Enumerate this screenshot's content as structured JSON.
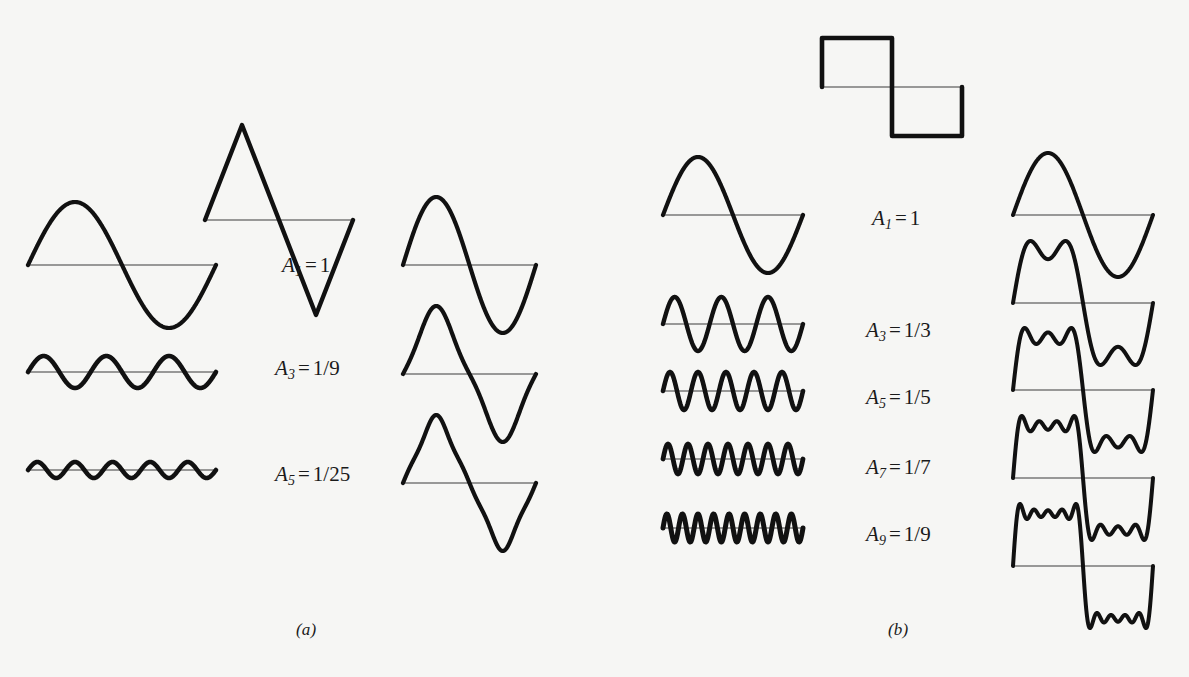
{
  "figure": {
    "background_color": "#f6f6f4",
    "ink_color": "#111111",
    "width": 1189,
    "height": 677
  },
  "panels": [
    {
      "id": "a",
      "label": "(a)",
      "label_x": 296,
      "label_y": 620,
      "target_waveform": "triangle",
      "target": {
        "x": 205,
        "y": 125,
        "width": 148,
        "height": 190,
        "period_points": [
          [
            0,
            0
          ],
          [
            0.25,
            1
          ],
          [
            0.75,
            -1
          ],
          [
            1,
            0
          ]
        ]
      },
      "amplitude_labels": [
        {
          "harmonic": "1",
          "value": "1",
          "x": 282,
          "y": 253
        },
        {
          "harmonic": "3",
          "value": "1/9",
          "x": 275,
          "y": 356
        },
        {
          "harmonic": "5",
          "value": "1/25",
          "x": 275,
          "y": 462
        }
      ],
      "components": [
        {
          "harmonic": 1,
          "amplitude": 1.0,
          "cycles": 1,
          "baseline_x": 28,
          "baseline_y": 265,
          "length": 188,
          "pixel_amplitude": 63,
          "stroke": 4.2
        },
        {
          "harmonic": 3,
          "amplitude": 0.1111,
          "cycles": 3,
          "baseline_x": 28,
          "baseline_y": 372,
          "length": 188,
          "pixel_amplitude": 16,
          "stroke": 4.6
        },
        {
          "harmonic": 5,
          "amplitude": 0.04,
          "cycles": 5,
          "baseline_x": 28,
          "baseline_y": 470,
          "length": 188,
          "pixel_amplitude": 8,
          "stroke": 4.6
        }
      ],
      "partial_sums": [
        {
          "through_harmonic": 1,
          "terms": [
            1
          ],
          "baseline_x": 403,
          "baseline_y": 265,
          "length": 133,
          "pixel_amplitude": 68,
          "stroke": 4.2
        },
        {
          "through_harmonic": 3,
          "terms": [
            1,
            3
          ],
          "baseline_x": 403,
          "baseline_y": 374,
          "length": 133,
          "pixel_amplitude": 68,
          "stroke": 4.2
        },
        {
          "through_harmonic": 5,
          "terms": [
            1,
            3,
            5
          ],
          "baseline_x": 403,
          "baseline_y": 483,
          "length": 133,
          "pixel_amplitude": 68,
          "stroke": 4.2
        }
      ]
    },
    {
      "id": "b",
      "label": "(b)",
      "label_x": 888,
      "label_y": 620,
      "target_waveform": "square",
      "target": {
        "x": 822,
        "y": 38,
        "width": 140,
        "height": 98
      },
      "amplitude_labels": [
        {
          "harmonic": "1",
          "value": "1",
          "x": 872,
          "y": 206
        },
        {
          "harmonic": "3",
          "value": "1/3",
          "x": 866,
          "y": 318
        },
        {
          "harmonic": "5",
          "value": "1/5",
          "x": 866,
          "y": 385
        },
        {
          "harmonic": "7",
          "value": "1/7",
          "x": 866,
          "y": 455
        },
        {
          "harmonic": "9",
          "value": "1/9",
          "x": 866,
          "y": 522
        }
      ],
      "components": [
        {
          "harmonic": 1,
          "amplitude": 1.0,
          "cycles": 1,
          "baseline_x": 663,
          "baseline_y": 215,
          "length": 140,
          "pixel_amplitude": 58,
          "stroke": 4.2
        },
        {
          "harmonic": 3,
          "amplitude": 0.3333,
          "cycles": 3,
          "baseline_x": 663,
          "baseline_y": 324,
          "length": 140,
          "pixel_amplitude": 27,
          "stroke": 4.4
        },
        {
          "harmonic": 5,
          "amplitude": 0.2,
          "cycles": 5,
          "baseline_x": 663,
          "baseline_y": 391,
          "length": 140,
          "pixel_amplitude": 19,
          "stroke": 4.6
        },
        {
          "harmonic": 7,
          "amplitude": 0.1428,
          "cycles": 7,
          "baseline_x": 663,
          "baseline_y": 459,
          "length": 140,
          "pixel_amplitude": 15,
          "stroke": 4.8
        },
        {
          "harmonic": 9,
          "amplitude": 0.1111,
          "cycles": 9,
          "baseline_x": 663,
          "baseline_y": 528,
          "length": 140,
          "pixel_amplitude": 14,
          "stroke": 5.0
        }
      ],
      "partial_sums": [
        {
          "through_harmonic": 1,
          "terms": [
            1
          ],
          "baseline_x": 1013,
          "baseline_y": 215,
          "length": 140,
          "pixel_amplitude": 62,
          "stroke": 4.0
        },
        {
          "through_harmonic": 3,
          "terms": [
            1,
            3
          ],
          "baseline_x": 1013,
          "baseline_y": 303,
          "length": 140,
          "pixel_amplitude": 62,
          "stroke": 4.0
        },
        {
          "through_harmonic": 5,
          "terms": [
            1,
            3,
            5
          ],
          "baseline_x": 1013,
          "baseline_y": 390,
          "length": 140,
          "pixel_amplitude": 62,
          "stroke": 4.0
        },
        {
          "through_harmonic": 7,
          "terms": [
            1,
            3,
            5,
            7
          ],
          "baseline_x": 1013,
          "baseline_y": 478,
          "length": 140,
          "pixel_amplitude": 62,
          "stroke": 4.0
        },
        {
          "through_harmonic": 9,
          "terms": [
            1,
            3,
            5,
            7,
            9
          ],
          "baseline_x": 1013,
          "baseline_y": 566,
          "length": 140,
          "pixel_amplitude": 62,
          "stroke": 4.0
        }
      ]
    }
  ]
}
